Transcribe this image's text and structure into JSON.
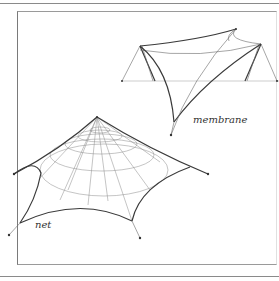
{
  "figure": {
    "title": "",
    "labels": {
      "membrane": "membrane",
      "net": "net"
    },
    "subjects": [
      {
        "name": "membrane",
        "description": "saddle-shaped tensile membrane supported by two masts with guy cables"
      },
      {
        "name": "net",
        "description": "cone-shaped cable net with radial and ring cables anchored at six points"
      }
    ]
  },
  "colors": {
    "line": "#3a3a3a",
    "frame": "#7a7a7a",
    "background": "#ffffff"
  }
}
